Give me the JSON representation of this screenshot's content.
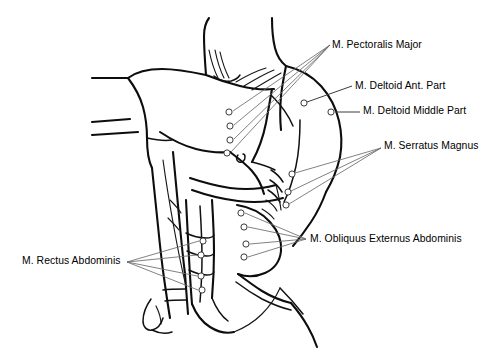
{
  "figure": {
    "background_color": "#ffffff",
    "line_color": "#0d0d0d",
    "leader_color": "#6b6b6b",
    "marker_fill": "#ffffff",
    "width": 498,
    "height": 359
  },
  "labels": [
    {
      "id": "pectoralis-major",
      "text": "M. Pectoralis Major",
      "x": 332,
      "y": 39,
      "marker_count": 4
    },
    {
      "id": "deltoid-anterior",
      "text": "M. Deltoid Ant. Part",
      "x": 355,
      "y": 80,
      "marker_count": 1
    },
    {
      "id": "deltoid-middle",
      "text": "M. Deltoid Middle Part",
      "x": 363,
      "y": 105,
      "marker_count": 1
    },
    {
      "id": "serratus-magnus",
      "text": "M. Serratus Magnus",
      "x": 384,
      "y": 140,
      "marker_count": 3
    },
    {
      "id": "obliquus-externus-abdominis",
      "text": "M. Obliquus Externus Abdominis",
      "x": 310,
      "y": 233,
      "marker_count": 4
    },
    {
      "id": "rectus-abdominis",
      "text": "M. Rectus Abdominis",
      "x": 22,
      "y": 255,
      "marker_count": 4
    }
  ],
  "markers": {
    "pectoralis_major": [
      {
        "cx": 229,
        "cy": 112
      },
      {
        "cx": 230,
        "cy": 126
      },
      {
        "cx": 230,
        "cy": 140
      },
      {
        "cx": 227,
        "cy": 153
      }
    ],
    "deltoid_anterior": [
      {
        "cx": 304,
        "cy": 103
      }
    ],
    "deltoid_middle": [
      {
        "cx": 331,
        "cy": 112
      }
    ],
    "serratus_magnus": [
      {
        "cx": 292,
        "cy": 174
      },
      {
        "cx": 288,
        "cy": 192
      },
      {
        "cx": 286,
        "cy": 205
      }
    ],
    "obliquus_externus": [
      {
        "cx": 241,
        "cy": 213
      },
      {
        "cx": 244,
        "cy": 227
      },
      {
        "cx": 246,
        "cy": 244
      },
      {
        "cx": 244,
        "cy": 257
      }
    ],
    "rectus_abdominis": [
      {
        "cx": 203,
        "cy": 241
      },
      {
        "cx": 201,
        "cy": 255
      },
      {
        "cx": 201,
        "cy": 276
      },
      {
        "cx": 202,
        "cy": 290
      }
    ]
  },
  "convergence_points": {
    "pectoralis_major": {
      "x": 330,
      "y": 45
    },
    "serratus_magnus": {
      "x": 381,
      "y": 148
    },
    "obliquus_externus": {
      "x": 306,
      "y": 239
    },
    "rectus_abdominis": {
      "x": 127,
      "y": 262
    }
  }
}
